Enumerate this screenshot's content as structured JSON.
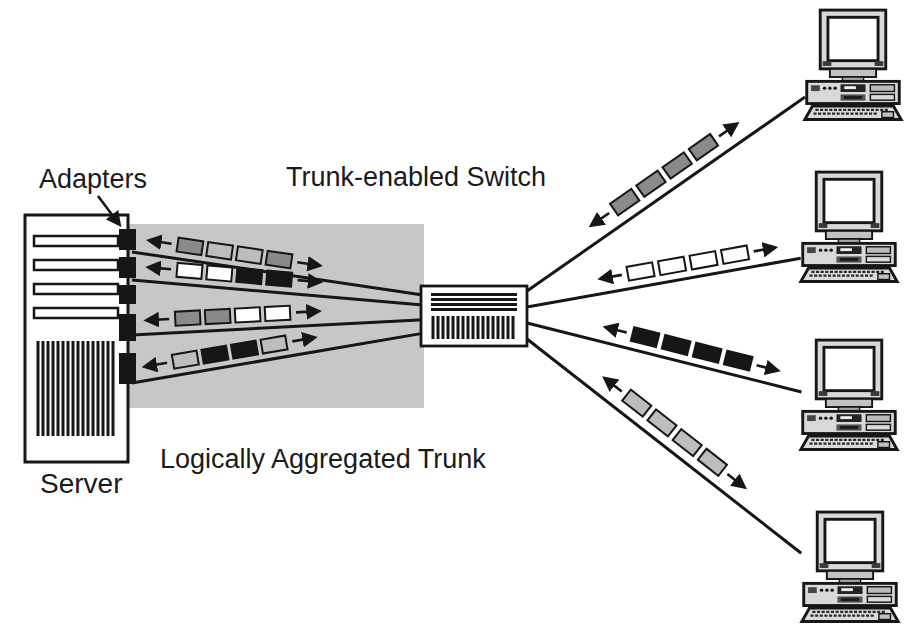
{
  "figure": {
    "labels": {
      "adapters": "Adapters",
      "trunk_switch": "Trunk-enabled Switch",
      "aggregated_trunk": "Logically Aggregated Trunk",
      "server": "Server"
    },
    "colors": {
      "dark-gray": "#8a8a8a",
      "light-gray": "#bdbdbd",
      "white": "#ffffff",
      "black": "#161616",
      "trunk-region": "#c7c7c7",
      "line": "#161616"
    },
    "nodes": {
      "server": {
        "label": "Server",
        "adapter_count": 5
      },
      "switch": {
        "label": "Trunk-enabled Switch"
      },
      "clients": [
        {
          "name": "client-1"
        },
        {
          "name": "client-2"
        },
        {
          "name": "client-3"
        },
        {
          "name": "client-4"
        }
      ]
    },
    "trunk_links": [
      {
        "name": "trunk-link-1",
        "bidirectional": true,
        "packets": [
          "dark-gray",
          "light-gray",
          "light-gray",
          "dark-gray"
        ]
      },
      {
        "name": "trunk-link-2",
        "bidirectional": true,
        "packets": [
          "white",
          "white",
          "black",
          "black"
        ]
      },
      {
        "name": "trunk-link-3",
        "bidirectional": true,
        "packets": [
          "dark-gray",
          "dark-gray",
          "white",
          "white"
        ]
      },
      {
        "name": "trunk-link-4",
        "bidirectional": true,
        "packets": [
          "light-gray",
          "black",
          "black",
          "light-gray"
        ]
      }
    ],
    "client_links": [
      {
        "name": "client-link-1",
        "bidirectional": true,
        "packets": [
          "dark-gray",
          "dark-gray",
          "dark-gray",
          "dark-gray"
        ]
      },
      {
        "name": "client-link-2",
        "bidirectional": true,
        "packets": [
          "white",
          "white",
          "white",
          "white"
        ]
      },
      {
        "name": "client-link-3",
        "bidirectional": true,
        "packets": [
          "black",
          "black",
          "black",
          "black"
        ]
      },
      {
        "name": "client-link-4",
        "bidirectional": true,
        "packets": [
          "light-gray",
          "light-gray",
          "light-gray",
          "light-gray"
        ]
      }
    ]
  }
}
